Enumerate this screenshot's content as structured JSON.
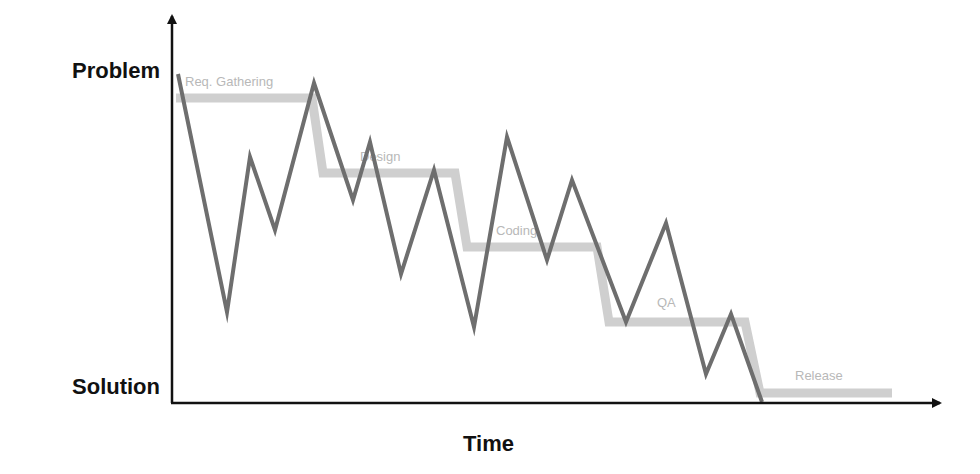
{
  "diagram": {
    "type": "process-timeline",
    "y_axis": {
      "top_label": "Problem",
      "bottom_label": "Solution"
    },
    "x_axis": {
      "label": "Time"
    },
    "phases": [
      {
        "label": "Req. Gathering",
        "level_y": 98,
        "x_start": 176,
        "x_end": 312,
        "drop_to_x": 323
      },
      {
        "label": "Design",
        "level_y": 173,
        "x_start": 323,
        "x_end": 455,
        "drop_to_x": 467
      },
      {
        "label": "Coding",
        "level_y": 247,
        "x_start": 467,
        "x_end": 597,
        "drop_to_x": 609
      },
      {
        "label": "QA",
        "level_y": 322,
        "x_start": 609,
        "x_end": 745,
        "drop_to_x": 760
      },
      {
        "label": "Release",
        "level_y": 393,
        "x_start": 760,
        "x_end": 892
      }
    ],
    "actual_path": [
      [
        178,
        74
      ],
      [
        227,
        312
      ],
      [
        250,
        157
      ],
      [
        275,
        230
      ],
      [
        314,
        83
      ],
      [
        353,
        200
      ],
      [
        370,
        142
      ],
      [
        401,
        274
      ],
      [
        434,
        170
      ],
      [
        474,
        327
      ],
      [
        507,
        137
      ],
      [
        547,
        260
      ],
      [
        572,
        180
      ],
      [
        626,
        322
      ],
      [
        666,
        223
      ],
      [
        706,
        374
      ],
      [
        731,
        314
      ],
      [
        762,
        402
      ]
    ],
    "colors": {
      "axis": "#111111",
      "phase_band": "#cfcfcf",
      "phase_text": "#b8b8b8",
      "actual_line": "#6e6e6e"
    }
  }
}
